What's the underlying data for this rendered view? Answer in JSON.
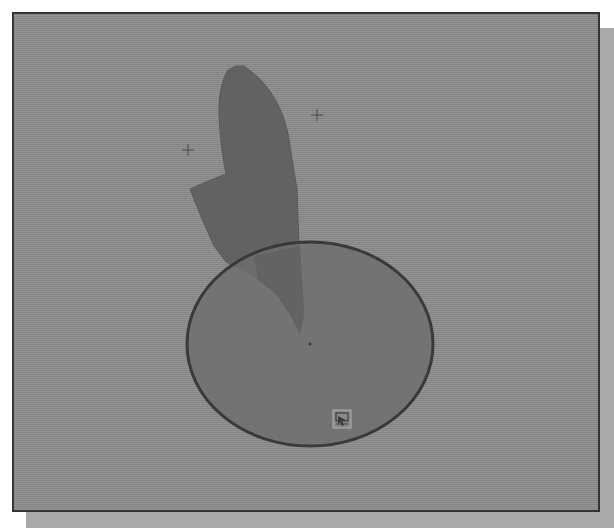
{
  "viewport": {
    "name": "drawing-viewport",
    "background_color": "#8c8c8c",
    "border_color": "#333333"
  },
  "drawing": {
    "silhouette": {
      "fill": "#646464",
      "outline": "#555555"
    },
    "circle": {
      "fill": "#727272",
      "stroke": "#3a3a3a",
      "cx": 296,
      "cy": 330,
      "rx": 123,
      "ry": 102
    },
    "crosshair_markers": [
      {
        "name": "marker-left",
        "x": 174,
        "y": 136
      },
      {
        "name": "marker-right",
        "x": 303,
        "y": 101
      }
    ],
    "center_point": {
      "x": 296,
      "y": 330
    }
  },
  "cursor_badge": {
    "icon": "select-object-icon",
    "x": 319,
    "y": 396
  }
}
